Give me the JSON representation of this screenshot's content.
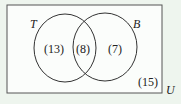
{
  "diagram": {
    "type": "venn",
    "universe_label": "U",
    "sets": [
      {
        "label": "T",
        "only": "(13)"
      },
      {
        "label": "B",
        "only": "(7)"
      }
    ],
    "intersection": "(8)",
    "outside": "(15)",
    "colors": {
      "background": "#eef5ee",
      "box": "#fbfdfb",
      "stroke": "#333333"
    }
  }
}
